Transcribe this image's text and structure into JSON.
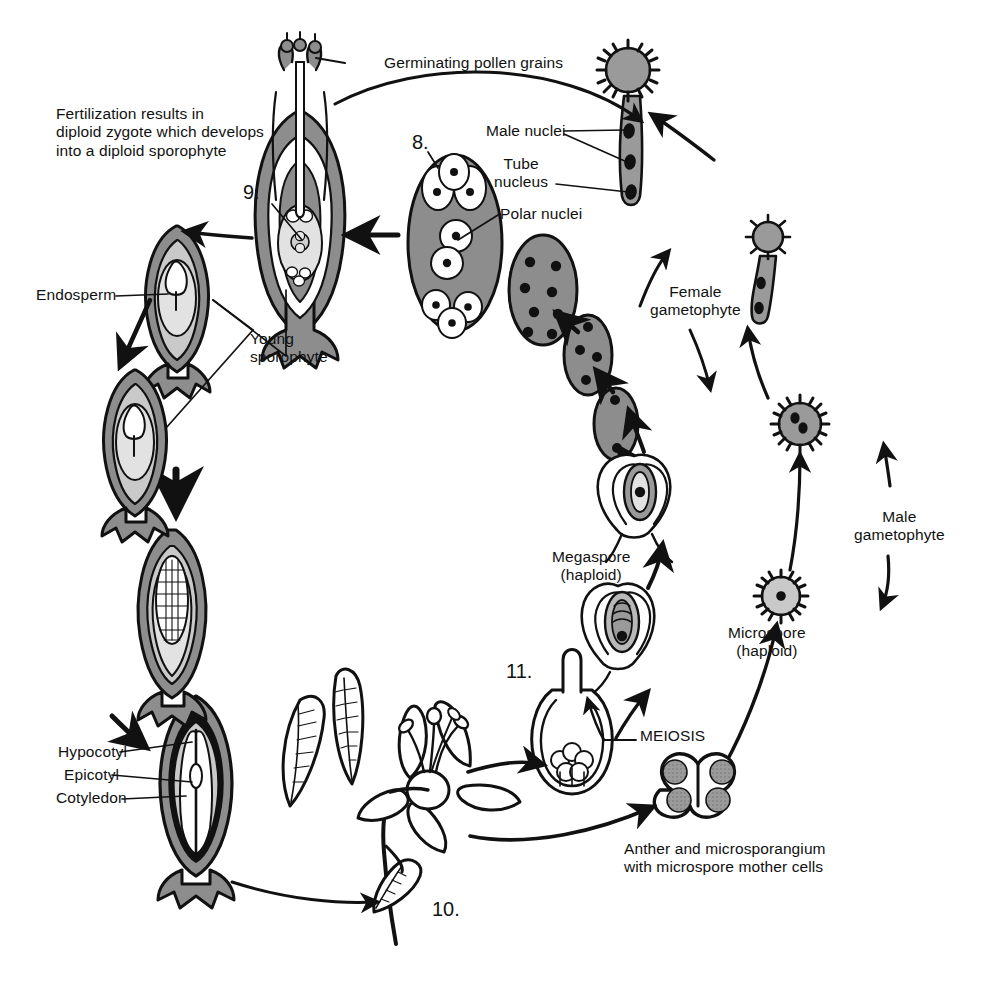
{
  "diagram": {
    "colors": {
      "ink": "#111111",
      "tissue_mid": "#8d8d8d",
      "tissue_light": "#c9c9c9",
      "tissue_pale": "#e2e2e2",
      "white": "#ffffff"
    }
  },
  "labels": {
    "fertilization": "Fertilization results in\ndiploid zygote which develops\ninto a diploid sporophyte",
    "germinating_pollen": "Germinating pollen grains",
    "male_nuclei": "Male nuclei",
    "tube_nucleus": "Tube\nnucleus",
    "polar_nuclei": "Polar nuclei",
    "female_gametophyte": "Female\ngametophyte",
    "male_gametophyte": "Male\ngametophyte",
    "microspore": "Microspore\n(haploid)",
    "megaspore": "Megaspore\n(haploid)",
    "meiosis": "MEIOSIS",
    "anther": "Anther and microsporangium\nwith microspore mother cells",
    "endosperm": "Endosperm",
    "young_sporophyte": "Young\nsporophyte",
    "hypocotyl": "Hypocotyl",
    "epicotyl": "Epicotyl",
    "cotyledon": "Cotyledon"
  },
  "numbers": {
    "n8": "8.",
    "n9": "9.",
    "n10": "10.",
    "n11": "11."
  }
}
